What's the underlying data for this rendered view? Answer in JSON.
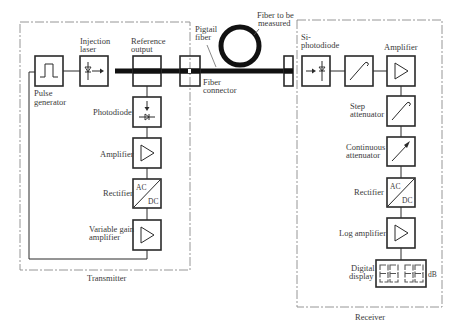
{
  "diagram": {
    "transmitter": {
      "label": "Transmitter",
      "blocks": [
        {
          "id": "pulse-generator",
          "label_line1": "Pulse",
          "label_line2": "generator",
          "symbol": "square-pulse"
        },
        {
          "id": "injection-laser",
          "label_line1": "Injection",
          "label_line2": "laser",
          "symbol": "laser-diode"
        },
        {
          "id": "reference-output",
          "label_line1": "Reference",
          "label_line2": "output",
          "symbol": "none"
        },
        {
          "id": "photodiode",
          "label": "Photodiode",
          "symbol": "photodiode"
        },
        {
          "id": "amplifier",
          "label": "Amplifier",
          "symbol": "triangle"
        },
        {
          "id": "rectifier",
          "label": "Rectifier",
          "symbol": "ac-dc",
          "ac": "AC",
          "dc": "DC"
        },
        {
          "id": "variable-gain-amplifier",
          "label_line1": "Variable gain",
          "label_line2": "amplifier",
          "symbol": "triangle"
        }
      ]
    },
    "fiber": {
      "pigtail_line1": "Pigtail",
      "pigtail_line2": "fiber",
      "under_test_line1": "Fiber to be",
      "under_test_line2": "measured",
      "connector_line1": "Fiber",
      "connector_line2": "connector"
    },
    "receiver": {
      "label": "Receiver",
      "blocks": [
        {
          "id": "si-photodiode",
          "label_line1": "Si-",
          "label_line2": "photodiode",
          "symbol": "photodiode"
        },
        {
          "id": "filter",
          "label": "",
          "symbol": "step-curve"
        },
        {
          "id": "amplifier",
          "label": "Amplifier",
          "symbol": "triangle"
        },
        {
          "id": "step-attenuator",
          "label_line1": "Step",
          "label_line2": "attenuator",
          "symbol": "step-curve"
        },
        {
          "id": "continuous-attenuator",
          "label_line1": "Continuous",
          "label_line2": "attenuator",
          "symbol": "arrow-diagonal"
        },
        {
          "id": "rectifier",
          "label": "Rectifier",
          "symbol": "ac-dc",
          "ac": "AC",
          "dc": "DC"
        },
        {
          "id": "log-amplifier",
          "label": "Log amplifier",
          "symbol": "triangle"
        },
        {
          "id": "digital-display",
          "label_line1": "Digital",
          "label_line2": "display",
          "symbol": "seven-segment",
          "digits": "88.88",
          "unit": "dB"
        }
      ]
    }
  }
}
